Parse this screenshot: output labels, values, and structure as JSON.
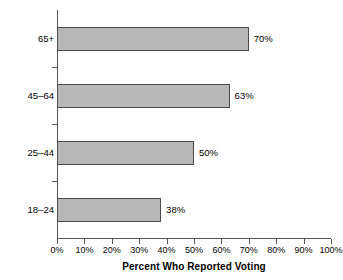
{
  "chart_data": {
    "type": "bar",
    "orientation": "horizontal",
    "title": "",
    "xlabel": "Percent Who Reported Voting",
    "ylabel": "Age",
    "categories": [
      "18–24",
      "25–44",
      "45–64",
      "65+"
    ],
    "values": [
      38,
      50,
      63,
      70
    ],
    "value_labels": [
      "38%",
      "50%",
      "63%",
      "70%"
    ],
    "xlim": [
      0,
      100
    ],
    "xticks": [
      0,
      10,
      20,
      30,
      40,
      50,
      60,
      70,
      80,
      90,
      100
    ],
    "xtick_labels": [
      "0%",
      "10%",
      "20%",
      "30%",
      "40%",
      "50%",
      "60%",
      "70%",
      "80%",
      "90%",
      "100%"
    ],
    "grid": false,
    "legend": false,
    "bar_color": "#b7b7b7",
    "bar_border_color": "#4a4a4a",
    "axis_color": "#555555",
    "background": "#ffffff"
  }
}
